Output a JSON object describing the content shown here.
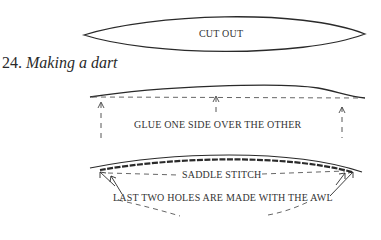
{
  "figure": {
    "number": "24.",
    "title": "Making a dart"
  },
  "step1": {
    "label": "CUT OUT"
  },
  "step2": {
    "label": "GLUE ONE SIDE OVER THE OTHER"
  },
  "step3": {
    "label_stitch": "SADDLE STITCH",
    "label_holes": "LAST TWO HOLES ARE MADE WITH THE AWL"
  },
  "colors": {
    "ink": "#2a2a2a",
    "background": "#ffffff"
  }
}
